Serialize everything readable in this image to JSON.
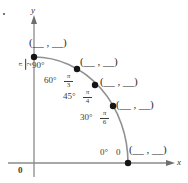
{
  "figure": {
    "type": "unit-circle-quadrant-worksheet",
    "axes": {
      "x_label": "x",
      "y_label": "y",
      "origin_label": "0"
    },
    "colors": {
      "curve": "#8c8c8c",
      "axis": "#8a8a8a",
      "point": "#1a1a1a",
      "text": "#3c3c3c"
    },
    "blank_answer": "(__ , __)",
    "points": [
      {
        "id": "p90",
        "degrees": "90°",
        "radian_num": "π",
        "radian_den": "2",
        "radian_plain": "π/2",
        "answer": "(__ , __)"
      },
      {
        "id": "p60",
        "degrees": "60°",
        "radian_num": "π",
        "radian_den": "3",
        "radian_plain": "π/3",
        "answer": "(__ , __)"
      },
      {
        "id": "p45",
        "degrees": "45°",
        "radian_num": "π",
        "radian_den": "4",
        "radian_plain": "π/4",
        "answer": "(__ , __)"
      },
      {
        "id": "p30",
        "degrees": "30°",
        "radian_num": "π",
        "radian_den": "6",
        "radian_plain": "π/6",
        "answer": "(__ , __)"
      },
      {
        "id": "p0",
        "degrees": "0°",
        "radian_num": "",
        "radian_den": "",
        "radian_plain": "0",
        "answer": "(__ , __)"
      }
    ]
  }
}
